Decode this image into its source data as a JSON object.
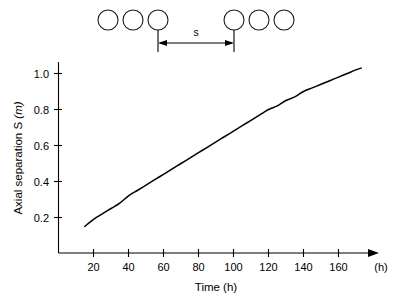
{
  "chart_data": {
    "type": "line",
    "title": "",
    "xlabel": "Time  (h)",
    "ylabel": "Axial separation S (m)",
    "ylabel_main": "Axial separation S ",
    "ylabel_unit": "(m)",
    "x_axis_end_unit": "(h)",
    "xlim": [
      0,
      180
    ],
    "ylim": [
      0,
      1.12
    ],
    "xticks": [
      20,
      40,
      60,
      80,
      100,
      120,
      140,
      160
    ],
    "yticks": [
      "0.2",
      "0.4",
      "0.6",
      "0.8",
      "1.0"
    ],
    "ytick_values": [
      0.2,
      0.4,
      0.6,
      0.8,
      1.0
    ],
    "grid": false,
    "legend": null,
    "series": [
      {
        "name": "Axial separation",
        "x": [
          15,
          20,
          25,
          30,
          35,
          40,
          45,
          50,
          55,
          60,
          65,
          70,
          75,
          80,
          85,
          90,
          95,
          100,
          105,
          110,
          115,
          120,
          125,
          130,
          135,
          140,
          145,
          150,
          155,
          160,
          165,
          170,
          173
        ],
        "values": [
          0.15,
          0.19,
          0.22,
          0.25,
          0.28,
          0.32,
          0.35,
          0.38,
          0.41,
          0.44,
          0.47,
          0.5,
          0.53,
          0.56,
          0.59,
          0.62,
          0.65,
          0.68,
          0.71,
          0.74,
          0.77,
          0.8,
          0.82,
          0.85,
          0.87,
          0.9,
          0.92,
          0.94,
          0.96,
          0.98,
          1.0,
          1.02,
          1.03
        ]
      }
    ],
    "annotations": {
      "schematic_label": "s",
      "circle_count": 6,
      "description": "Row of six circles with dimension arrow labelled s spanning the gap between the third and fourth circle"
    }
  },
  "schematic": {
    "label": "s",
    "circles": [
      {
        "cx": 108,
        "cy": 20,
        "r": 10
      },
      {
        "cx": 132,
        "cy": 20,
        "r": 10
      },
      {
        "cx": 157,
        "cy": 20,
        "r": 10
      },
      {
        "cx": 235,
        "cy": 20,
        "r": 10
      },
      {
        "cx": 259,
        "cy": 20,
        "r": 10
      },
      {
        "cx": 283,
        "cy": 20,
        "r": 10
      }
    ],
    "dimension": {
      "x1": 158,
      "x2": 234,
      "y": 42,
      "top": 28,
      "bottom": 50
    }
  }
}
